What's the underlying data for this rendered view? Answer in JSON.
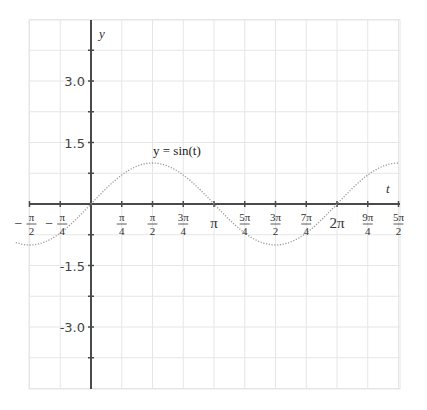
{
  "chart_data": {
    "type": "line",
    "title": "",
    "xlabel": "t",
    "ylabel": "y",
    "xlim": [
      -1.9635,
      7.854
    ],
    "ylim": [
      -4.5,
      4.5
    ],
    "grid": true,
    "x_ticks": [
      {
        "value": -1.5708,
        "num": "π",
        "den": "2",
        "neg": true
      },
      {
        "value": -0.7854,
        "num": "π",
        "den": "4",
        "neg": true
      },
      {
        "value": 0.7854,
        "num": "π",
        "den": "4",
        "neg": false
      },
      {
        "value": 1.5708,
        "num": "π",
        "den": "2",
        "neg": false
      },
      {
        "value": 2.3562,
        "num": "3π",
        "den": "4",
        "neg": false
      },
      {
        "value": 3.1416,
        "label": "π"
      },
      {
        "value": 3.927,
        "num": "5π",
        "den": "4",
        "neg": false
      },
      {
        "value": 4.7124,
        "num": "3π",
        "den": "2",
        "neg": false
      },
      {
        "value": 5.4978,
        "num": "7π",
        "den": "4",
        "neg": false
      },
      {
        "value": 6.2832,
        "label": "2π"
      },
      {
        "value": 7.0686,
        "num": "9π",
        "den": "4",
        "neg": false
      },
      {
        "value": 7.854,
        "num": "5π",
        "den": "2",
        "neg": false
      }
    ],
    "y_ticks": [
      {
        "value": 3.0,
        "label": "3.0"
      },
      {
        "value": 1.5,
        "label": "1.5"
      },
      {
        "value": -1.5,
        "label": "-1.5"
      },
      {
        "value": -3.0,
        "label": "-3.0"
      }
    ],
    "y_minor_ticks": [
      3.75,
      2.25,
      0.75,
      -0.75,
      -2.25,
      -3.75
    ],
    "series": [
      {
        "name": "y = sin(t)",
        "function": "sin(t)",
        "style": "dotted",
        "color": "#9a9a9a",
        "x_range": [
          -1.5708,
          7.854
        ]
      }
    ],
    "annotations": [
      {
        "text": "y = sin(t)",
        "x": 1.5708,
        "y": 1.2
      }
    ]
  },
  "labels": {
    "x_axis": "t",
    "y_axis": "y",
    "function": "y = sin(t)"
  },
  "colors": {
    "axis": "#4a4a4a",
    "grid": "#e6e6e6",
    "curve": "#9a9a9a"
  }
}
